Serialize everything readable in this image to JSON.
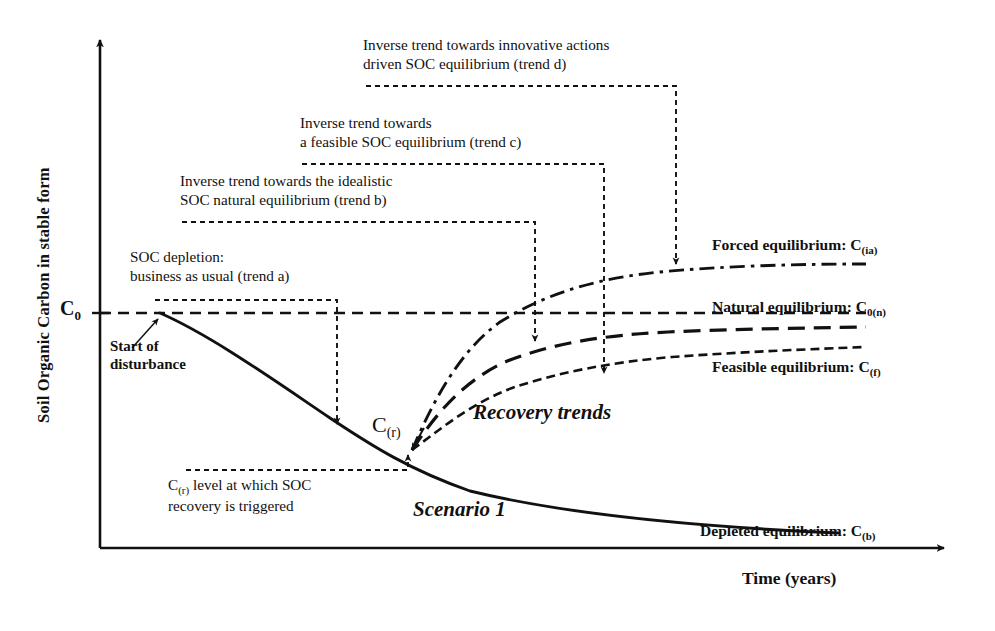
{
  "figure": {
    "domain": "diagram",
    "type": "conceptual-line-diagram",
    "axes": {
      "y_title": "Soil Organic Carbon in stable form",
      "x_title": "Time (years)",
      "y_tick_label": "C",
      "y_tick_sub": "0",
      "y_tick_value_px": 313,
      "origin_px": [
        100,
        548
      ]
    },
    "annotations": [
      {
        "id": "trend-d",
        "line1": "Inverse trend towards innovative actions",
        "line2": "driven SOC equilibrium (trend d)"
      },
      {
        "id": "trend-c",
        "line1": "Inverse trend towards",
        "line2": "a feasible SOC equilibrium (trend c)"
      },
      {
        "id": "trend-b",
        "line1": "Inverse trend towards the idealistic",
        "line2": "SOC natural equilibrium (trend b)"
      },
      {
        "id": "trend-a",
        "line1": "SOC depletion:",
        "line2": "business as usual (trend a)"
      }
    ],
    "cr_note": {
      "prefix": "C",
      "sub": "(r)",
      "line1_rest": " level at which SOC",
      "line2": "recovery is triggered"
    },
    "start_note": {
      "line1": "Start of",
      "line2": "disturbance"
    },
    "curve_label": {
      "text": "C",
      "sub": "(r)"
    },
    "scene_labels": {
      "recovery": "Recovery trends",
      "scenario": "Scenario 1"
    },
    "equilibria": [
      {
        "id": "forced",
        "label": "Forced equilibrium: ",
        "symbol": "C",
        "sub": "(ia)",
        "style": "dash-dot",
        "level_px": 268
      },
      {
        "id": "natural",
        "label": "Natural equilibrium: ",
        "symbol": "C",
        "sub": "0(n)",
        "style": "long-dash",
        "level_px": 330
      },
      {
        "id": "feasible",
        "label": "Feasible equilibrium: ",
        "symbol": "C",
        "sub": "(f)",
        "style": "short-dash",
        "level_px": 348
      },
      {
        "id": "depleted",
        "label": "Depleted equilibrium: ",
        "symbol": "C",
        "sub": "(b)",
        "style": "solid",
        "level_px": 512
      }
    ],
    "colors": {
      "ink": "#111111",
      "background": "#ffffff"
    }
  }
}
